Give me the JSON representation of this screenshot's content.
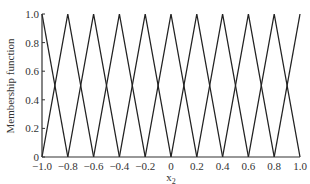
{
  "chart_data": {
    "type": "line",
    "title": "",
    "xlabel": "x2",
    "xlabel_main": "x",
    "xlabel_sub": "2",
    "ylabel": "Membership function",
    "xlim": [
      -1.0,
      1.0
    ],
    "ylim": [
      0,
      1.0
    ],
    "grid": false,
    "legend": "none",
    "x_ticks": [
      "-1.0",
      "-0.8",
      "-0.6",
      "-0.4",
      "-0.2",
      "0",
      "0.2",
      "0.4",
      "0.6",
      "0.8",
      "1.0"
    ],
    "y_ticks": [
      "0",
      "0.2",
      "0.4",
      "0.6",
      "0.8",
      "1.0"
    ],
    "series": [
      {
        "name": "MF1",
        "center": -1.0,
        "x": [
          -1.0,
          -0.8
        ],
        "y": [
          1,
          0
        ]
      },
      {
        "name": "MF2",
        "center": -0.8,
        "x": [
          -1.0,
          -0.8,
          -0.6
        ],
        "y": [
          0,
          1,
          0
        ]
      },
      {
        "name": "MF3",
        "center": -0.6,
        "x": [
          -0.8,
          -0.6,
          -0.4
        ],
        "y": [
          0,
          1,
          0
        ]
      },
      {
        "name": "MF4",
        "center": -0.4,
        "x": [
          -0.6,
          -0.4,
          -0.2
        ],
        "y": [
          0,
          1,
          0
        ]
      },
      {
        "name": "MF5",
        "center": -0.2,
        "x": [
          -0.4,
          -0.2,
          0.0
        ],
        "y": [
          0,
          1,
          0
        ]
      },
      {
        "name": "MF6",
        "center": 0.0,
        "x": [
          -0.2,
          0.0,
          0.2
        ],
        "y": [
          0,
          1,
          0
        ]
      },
      {
        "name": "MF7",
        "center": 0.2,
        "x": [
          0.0,
          0.2,
          0.4
        ],
        "y": [
          0,
          1,
          0
        ]
      },
      {
        "name": "MF8",
        "center": 0.4,
        "x": [
          0.2,
          0.4,
          0.6
        ],
        "y": [
          0,
          1,
          0
        ]
      },
      {
        "name": "MF9",
        "center": 0.6,
        "x": [
          0.4,
          0.6,
          0.8
        ],
        "y": [
          0,
          1,
          0
        ]
      },
      {
        "name": "MF10",
        "center": 0.8,
        "x": [
          0.6,
          0.8,
          1.0
        ],
        "y": [
          0,
          1,
          0
        ]
      },
      {
        "name": "MF11",
        "center": 1.0,
        "x": [
          0.8,
          1.0
        ],
        "y": [
          0,
          1
        ]
      }
    ]
  },
  "colors": {
    "line": "#222222",
    "axis": "#333333",
    "background": "#ffffff"
  }
}
